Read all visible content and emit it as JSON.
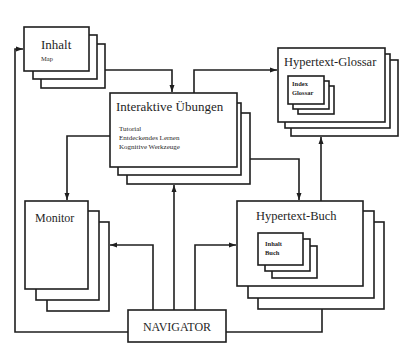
{
  "diagram": {
    "nodes": {
      "inhalt": {
        "title": "Inhalt",
        "subtitle": "Map"
      },
      "uebungen": {
        "title": "Interaktive Übungen",
        "items": [
          "Tutorial",
          "Entdeckendes Lernen",
          "Kognitive Werkzeuge"
        ]
      },
      "glossar": {
        "title": "Hypertext-Glossar",
        "inner": [
          "Index",
          "Glossar"
        ]
      },
      "monitor": {
        "title": "Monitor"
      },
      "buch": {
        "title": "Hypertext-Buch",
        "inner": [
          "Inhalt",
          "Buch"
        ]
      },
      "navigator": {
        "title": "NAVIGATOR"
      }
    },
    "edges": [
      {
        "from": "navigator",
        "to": "inhalt"
      },
      {
        "from": "inhalt",
        "to": "uebungen"
      },
      {
        "from": "uebungen",
        "to": "glossar"
      },
      {
        "from": "uebungen",
        "to": "monitor"
      },
      {
        "from": "uebungen",
        "to": "buch"
      },
      {
        "from": "buch",
        "to": "glossar"
      },
      {
        "from": "navigator",
        "to": "monitor"
      },
      {
        "from": "navigator",
        "to": "uebungen"
      },
      {
        "from": "navigator",
        "to": "buch"
      }
    ]
  }
}
